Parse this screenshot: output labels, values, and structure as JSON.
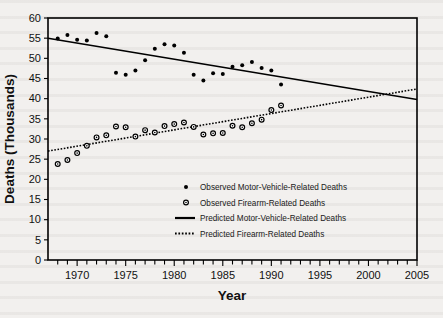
{
  "chart_data": {
    "type": "scatter",
    "title": "",
    "xlabel": "Year",
    "ylabel": "Deaths (Thousands)",
    "xlim": [
      1967,
      2005
    ],
    "ylim": [
      0,
      60
    ],
    "grid": false,
    "legend_position": "center",
    "x_ticks_major": [
      1970,
      1975,
      1980,
      1985,
      1990,
      1995,
      2000,
      2005
    ],
    "x_tick_labels": [
      "1970",
      "1975",
      "1980",
      "1985",
      "1990",
      "1995",
      "2000",
      "2005"
    ],
    "x_tick_interval_minor": 1,
    "y_ticks": [
      0,
      5,
      10,
      15,
      20,
      25,
      30,
      35,
      40,
      45,
      50,
      55,
      60
    ],
    "y_tick_labels": [
      "0",
      "5",
      "10",
      "15",
      "20",
      "25",
      "30",
      "35",
      "40",
      "45",
      "50",
      "55",
      "60"
    ],
    "series": [
      {
        "name": "Observed Motor-Vehicle-Related Deaths",
        "marker": "filled-circle",
        "type": "scatter",
        "x": [
          1968,
          1969,
          1970,
          1971,
          1972,
          1973,
          1974,
          1975,
          1976,
          1977,
          1978,
          1979,
          1980,
          1981,
          1982,
          1983,
          1984,
          1985,
          1986,
          1987,
          1988,
          1989,
          1990,
          1991
        ],
        "values": [
          54.9,
          55.8,
          54.6,
          54.4,
          56.3,
          55.5,
          46.4,
          45.9,
          47.0,
          49.5,
          52.4,
          53.5,
          53.2,
          51.4,
          45.9,
          44.5,
          46.3,
          46.1,
          47.9,
          48.3,
          49.1,
          47.6,
          47.0,
          43.5
        ],
        "units": "thousands"
      },
      {
        "name": "Observed Firearm-Related Deaths",
        "marker": "open-circle",
        "type": "scatter",
        "x": [
          1968,
          1969,
          1970,
          1971,
          1972,
          1973,
          1974,
          1975,
          1976,
          1977,
          1978,
          1979,
          1980,
          1981,
          1982,
          1983,
          1984,
          1985,
          1986,
          1987,
          1988,
          1989,
          1990,
          1991
        ],
        "values": [
          23.8,
          24.8,
          26.5,
          28.3,
          30.4,
          30.9,
          33.1,
          32.9,
          30.6,
          32.2,
          31.6,
          33.2,
          33.7,
          34.1,
          33.0,
          31.1,
          31.4,
          31.5,
          33.3,
          32.9,
          33.9,
          34.8,
          37.2,
          38.3
        ],
        "units": "thousands"
      },
      {
        "name": "Predicted Motor-Vehicle-Related Deaths",
        "type": "line",
        "style": "solid",
        "x": [
          1967,
          2005
        ],
        "values": [
          55.0,
          39.8
        ],
        "units": "thousands"
      },
      {
        "name": "Predicted Firearm-Related Deaths",
        "type": "line",
        "style": "dotted",
        "x": [
          1967,
          2005
        ],
        "values": [
          27.0,
          42.4
        ],
        "units": "thousands"
      }
    ],
    "annotations": [],
    "crossover_year_approx": 2003,
    "crossover_value_approx": 41.2
  },
  "legend": {
    "entries": [
      {
        "label": "Observed Motor-Vehicle-Related Deaths",
        "marker": "filled-circle"
      },
      {
        "label": "Observed Firearm-Related Deaths",
        "marker": "open-circle"
      },
      {
        "label": "Predicted Motor-Vehicle-Related Deaths",
        "marker": "solid-line"
      },
      {
        "label": "Predicted Firearm-Related Deaths",
        "marker": "dotted-line"
      }
    ]
  },
  "colors": {
    "ink": "#000000",
    "paper": "#f2f0ee"
  }
}
